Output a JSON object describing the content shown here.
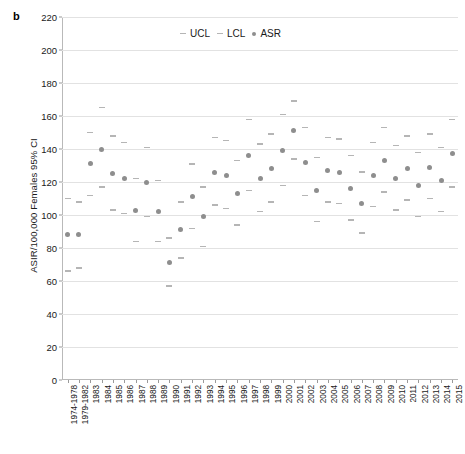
{
  "panel": {
    "label": "b"
  },
  "axes": {
    "y_title": "ASIR/100,000 Females 95% CI",
    "y_ticks": [
      0,
      20,
      40,
      60,
      80,
      100,
      120,
      140,
      160,
      180,
      200,
      220
    ],
    "y_min": 0,
    "y_max": 220
  },
  "legend": {
    "items": [
      {
        "label": "UCL",
        "marker": "dash-icon",
        "color": "#b5b5b5"
      },
      {
        "label": "LCL",
        "marker": "dash-icon",
        "color": "#b5b5b5"
      },
      {
        "label": "ASR",
        "marker": "dot-icon",
        "color": "#8e8e8e"
      }
    ]
  },
  "colors": {
    "asr": "#8e8e8e",
    "cl": "#b5b5b5",
    "grid": "#e2e2e2",
    "axis": "#b9b9b9"
  },
  "chart_data": {
    "type": "scatter",
    "title": "",
    "xlabel": "",
    "ylabel": "ASIR/100,000 Females 95% CI",
    "ylim": [
      0,
      220
    ],
    "grid": true,
    "legend_position": "top-center",
    "categories": [
      "1974-1978",
      "1979-1982",
      "1983",
      "1984",
      "1985",
      "1986",
      "1987",
      "1988",
      "1989",
      "1990",
      "1991",
      "1992",
      "1993",
      "1994",
      "1995",
      "1996",
      "1997",
      "1998",
      "1999",
      "2000",
      "2001",
      "2002",
      "2003",
      "2004",
      "2005",
      "2006",
      "2007",
      "2008",
      "2009",
      "2010",
      "2011",
      "2012",
      "2013",
      "2014",
      "2015"
    ],
    "series": [
      {
        "name": "ASR",
        "values": [
          88,
          88,
          131,
          140,
          125,
          122,
          103,
          120,
          102,
          71,
          91,
          111,
          99,
          126,
          124,
          113,
          136,
          122,
          128,
          139,
          151,
          132,
          115,
          127,
          126,
          116,
          107,
          124,
          133,
          122,
          128,
          118,
          129,
          121,
          137
        ]
      },
      {
        "name": "UCL",
        "values": [
          110,
          108,
          150,
          165,
          148,
          144,
          122,
          141,
          121,
          86,
          108,
          131,
          117,
          147,
          145,
          133,
          158,
          143,
          149,
          161,
          169,
          153,
          135,
          147,
          146,
          136,
          126,
          144,
          153,
          142,
          148,
          138,
          149,
          141,
          158
        ]
      },
      {
        "name": "LCL",
        "values": [
          66,
          68,
          112,
          117,
          103,
          101,
          84,
          99,
          84,
          57,
          74,
          92,
          81,
          106,
          104,
          94,
          115,
          102,
          108,
          118,
          134,
          112,
          96,
          108,
          107,
          97,
          89,
          105,
          114,
          103,
          109,
          99,
          110,
          102,
          117
        ]
      }
    ]
  }
}
